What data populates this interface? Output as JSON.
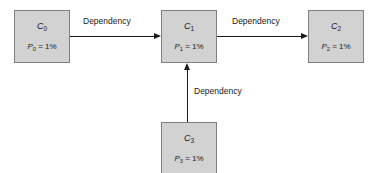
{
  "diagram": {
    "background_color": "#ffffff",
    "node_fill_color": "#d2d2d2",
    "node_border_color": "#808080",
    "edge_color": "#1a1a1a",
    "nodes": [
      {
        "id": "c0",
        "name_prefix": "C",
        "name_sub": "0",
        "prob_var": "P",
        "prob_sub": "0",
        "prob_value": "= 1%"
      },
      {
        "id": "c1",
        "name_prefix": "C",
        "name_sub": "1",
        "prob_var": "P",
        "prob_sub": "1",
        "prob_value": "= 1%"
      },
      {
        "id": "c2",
        "name_prefix": "C",
        "name_sub": "2",
        "prob_var": "P",
        "prob_sub": "2",
        "prob_value": "= 1%"
      },
      {
        "id": "c3",
        "name_prefix": "C",
        "name_sub": "3",
        "prob_var": "P",
        "prob_sub": "3",
        "prob_value": "= 1%"
      }
    ],
    "edges": [
      {
        "id": "c0-c1",
        "label": "Dependency",
        "from": "c0",
        "to": "c1",
        "direction": "right"
      },
      {
        "id": "c1-c2",
        "label": "Dependency",
        "from": "c1",
        "to": "c2",
        "direction": "right"
      },
      {
        "id": "c3-c1",
        "label": "Dependency",
        "from": "c3",
        "to": "c1",
        "direction": "up"
      }
    ]
  }
}
